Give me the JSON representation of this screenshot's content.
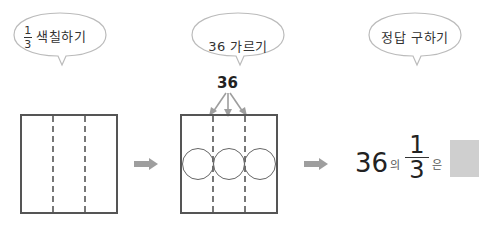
{
  "steps": [
    {
      "bubble": {
        "fraction": {
          "numerator": "1",
          "denominator": "3"
        },
        "label": "색칠하기"
      }
    },
    {
      "bubble": {
        "label": "36 가르기"
      },
      "total_label": "36",
      "groups": 3
    },
    {
      "bubble": {
        "label": "정답 구하기"
      }
    }
  ],
  "answer": {
    "whole": "36",
    "particle_of": "의",
    "fraction": {
      "numerator": "1",
      "denominator": "3"
    },
    "particle_topic": "은",
    "blank_color": "#cfcfcf"
  },
  "icons": {
    "arrow": "right-arrow-icon",
    "split": "down-arrow-icon"
  },
  "colors": {
    "arrow": "#9e9e9e",
    "box_border": "#555555",
    "dash": "#777777"
  }
}
